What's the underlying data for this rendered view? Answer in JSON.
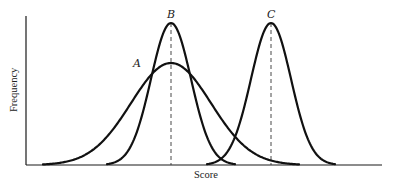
{
  "chart_data": {
    "type": "line",
    "title": "",
    "xlabel": "Score",
    "ylabel": "Frequency",
    "grid": false,
    "legend": null,
    "axis_ticks": false,
    "series": [
      {
        "name": "A",
        "shape": "normal",
        "relative_mean": 0.44,
        "relative_sd": 0.14,
        "relative_peak": 0.69,
        "description": "wide, low-peaked distribution"
      },
      {
        "name": "B",
        "shape": "normal",
        "relative_mean": 0.44,
        "relative_sd": 0.07,
        "relative_peak": 0.95,
        "description": "narrow distribution with same mean as A"
      },
      {
        "name": "C",
        "shape": "normal",
        "relative_mean": 0.72,
        "relative_sd": 0.07,
        "relative_peak": 0.95,
        "description": "narrow distribution, same spread as B, shifted right"
      }
    ],
    "annotations": [
      {
        "text": "A",
        "attached_to": "curve A, left shoulder"
      },
      {
        "text": "B",
        "attached_to": "peak of curve B"
      },
      {
        "text": "C",
        "attached_to": "peak of curve C"
      },
      {
        "type": "dashed-vertical-line",
        "at": "mean of A and B"
      },
      {
        "type": "dashed-vertical-line",
        "at": "mean of C"
      }
    ]
  },
  "labels": {
    "curve_a": "A",
    "curve_b": "B",
    "curve_c": "C",
    "x_axis": "Score",
    "y_axis": "Frequency"
  },
  "geometry": {
    "origin_x": 26,
    "baseline_y": 165,
    "axis_top_y": 16,
    "axis_right_x": 382,
    "curves": [
      {
        "id": "A",
        "mean_x": 171,
        "sd_px": 40,
        "peak_y": 63
      },
      {
        "id": "B",
        "mean_x": 171,
        "sd_px": 20,
        "peak_y": 23
      },
      {
        "id": "C",
        "mean_x": 271,
        "sd_px": 20,
        "peak_y": 23
      }
    ]
  }
}
